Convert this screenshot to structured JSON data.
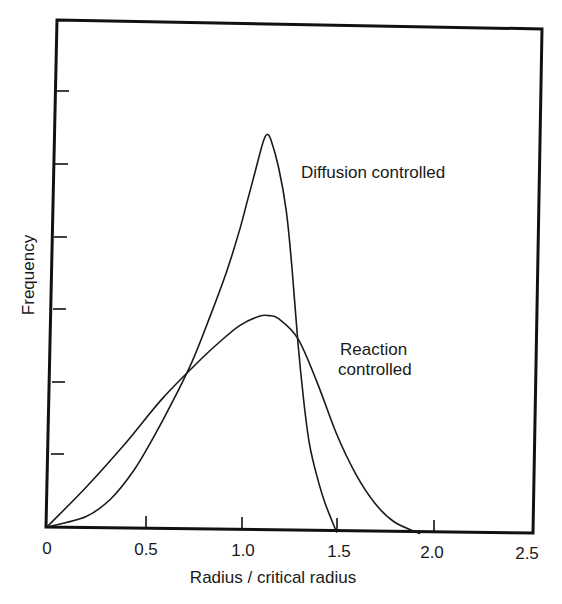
{
  "chart_data": {
    "type": "line",
    "title": "",
    "xlabel": "Radius / critical radius",
    "ylabel": "Frequency",
    "xlim": [
      0,
      2.5
    ],
    "ylim": [
      0,
      7
    ],
    "grid": false,
    "legend": "none (curves labeled directly)",
    "x_ticks": [
      0,
      0.5,
      1.0,
      1.5,
      2.0,
      2.5
    ],
    "x_tick_labels": [
      "0",
      "0.5",
      "1.0",
      "1.5",
      "2.0",
      "2.5"
    ],
    "y_ticks": [
      1,
      2,
      3,
      4,
      5,
      6
    ],
    "y_tick_labels": [],
    "series": [
      {
        "name": "Diffusion controlled",
        "peak": {
          "x": 1.14,
          "y": 5.45
        },
        "x": [
          0,
          0.2,
          0.33,
          0.45,
          0.55,
          0.65,
          0.75,
          0.84,
          0.93,
          1.0,
          1.04,
          1.08,
          1.12,
          1.14,
          1.16,
          1.2,
          1.24,
          1.27,
          1.3,
          1.33,
          1.36,
          1.4,
          1.44,
          1.5
        ],
        "values": [
          0,
          0.15,
          0.4,
          0.8,
          1.25,
          1.75,
          2.3,
          2.9,
          3.55,
          4.15,
          4.55,
          4.95,
          5.35,
          5.45,
          5.38,
          5.0,
          4.4,
          3.6,
          2.6,
          1.8,
          1.2,
          0.75,
          0.4,
          0
        ]
      },
      {
        "name": "Reaction controlled",
        "peak": {
          "x": 1.15,
          "y": 2.96
        },
        "x": [
          0,
          0.2,
          0.4,
          0.6,
          0.8,
          0.9,
          1.0,
          1.1,
          1.15,
          1.2,
          1.3,
          1.4,
          1.5,
          1.6,
          1.7,
          1.8,
          1.93
        ],
        "values": [
          0,
          0.55,
          1.15,
          1.8,
          2.35,
          2.6,
          2.82,
          2.95,
          2.96,
          2.92,
          2.65,
          2.05,
          1.35,
          0.8,
          0.4,
          0.15,
          0
        ]
      }
    ],
    "annotations": [
      {
        "text": "Diffusion controlled",
        "x": 1.32,
        "y": 4.7
      },
      {
        "text": "Reaction controlled",
        "x": 1.51,
        "y": 2.35
      }
    ]
  },
  "labels": {
    "xlabel": "Radius / critical radius",
    "ylabel": "Frequency",
    "x_ticks": [
      "0",
      "0.5",
      "1.0",
      "1.5",
      "2.0",
      "2.5"
    ],
    "annot_diffusion": "Diffusion controlled",
    "annot_reaction_line1": "Reaction",
    "annot_reaction_line2": "controlled"
  }
}
